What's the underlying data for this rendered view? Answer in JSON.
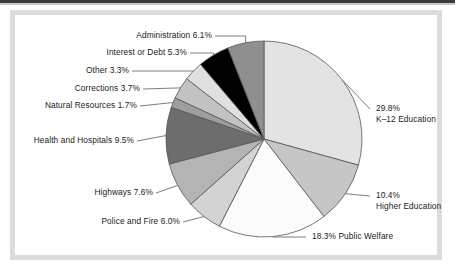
{
  "figure": {
    "title": "",
    "frame_color": "#dcdcdc",
    "background": "#ffffff"
  },
  "chart_data": {
    "type": "pie",
    "title": "",
    "xlabel": "",
    "ylabel": "",
    "legend_position": "callout-labels",
    "grid": false,
    "start_angle_deg": 0,
    "direction": "clockwise",
    "units": "percent",
    "total": 100.0,
    "categories": [
      "K–12 Education",
      "Higher Education",
      "Public Welfare",
      "Police and Fire",
      "Highways",
      "Health and Hospitals",
      "Natural Resources",
      "Corrections",
      "Other",
      "Interest or Debt",
      "Administration"
    ],
    "values": [
      29.8,
      10.4,
      18.3,
      6.0,
      7.6,
      9.5,
      1.7,
      3.7,
      3.3,
      5.3,
      6.1
    ],
    "colors": [
      "#e3e3e3",
      "#c6c6c6",
      "#fbfbfb",
      "#d3d3d3",
      "#b4b4b4",
      "#6d6d6d",
      "#9e9e9e",
      "#c2c2c2",
      "#e0e0e0",
      "#000000",
      "#8f8f8f"
    ],
    "slice_edge_color": "#555555",
    "labels": [
      {
        "text": "29.8%",
        "text2": "K–12 Education",
        "side": "right"
      },
      {
        "text": "10.4%",
        "text2": "Higher Education",
        "side": "right"
      },
      {
        "text": "18.3% Public Welfare",
        "text2": "",
        "side": "right"
      },
      {
        "text": "Police and Fire 6.0%",
        "text2": "",
        "side": "left"
      },
      {
        "text": "Highways 7.6%",
        "text2": "",
        "side": "left"
      },
      {
        "text": "Health and Hospitals 9.5%",
        "text2": "",
        "side": "left"
      },
      {
        "text": "Natural Resources 1.7%",
        "text2": "",
        "side": "left"
      },
      {
        "text": "Corrections 3.7%",
        "text2": "",
        "side": "left"
      },
      {
        "text": "Other 3.3%",
        "text2": "",
        "side": "left"
      },
      {
        "text": "Interest or Debt 5.3%",
        "text2": "",
        "side": "left"
      },
      {
        "text": "Administration 6.1%",
        "text2": "",
        "side": "left"
      }
    ]
  },
  "callouts": {
    "administration": "Administration 6.1%",
    "interest_or_debt": "Interest or Debt 5.3%",
    "other": "Other 3.3%",
    "corrections": "Corrections 3.7%",
    "natural_resources": "Natural Resources 1.7%",
    "health_and_hospitals": "Health and Hospitals 9.5%",
    "highways": "Highways 7.6%",
    "police_and_fire": "Police and Fire 6.0%",
    "public_welfare": "18.3% Public Welfare",
    "higher_education_pct": "10.4%",
    "higher_education_name": "Higher Education",
    "k12_pct": "29.8%",
    "k12_name": "K–12 Education"
  }
}
